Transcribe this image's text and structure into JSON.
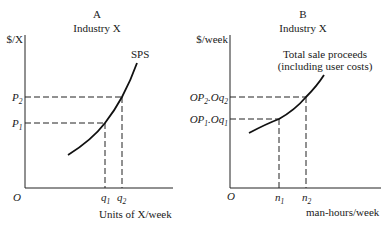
{
  "panel_a": {
    "letter": "A",
    "title": "Industry X",
    "y_label": "$/X",
    "x_label": "Units of X/week",
    "origin": "O",
    "curve_label": "SPS",
    "y_ticks": [
      {
        "base": "P",
        "sub": "2"
      },
      {
        "base": "P",
        "sub": "1"
      }
    ],
    "x_ticks": [
      {
        "base": "q",
        "sub": "1"
      },
      {
        "base": "q",
        "sub": "2"
      }
    ]
  },
  "panel_b": {
    "letter": "B",
    "title": "Industry X",
    "y_label": "$/week",
    "x_label": "man-hours/week",
    "origin": "O",
    "curve_label_line1": "Total sale proceeds",
    "curve_label_line2": "(including user costs)",
    "y_ticks": [
      {
        "base1": "OP",
        "sub1": "2",
        "mid": ".Oq",
        "sub2": "2"
      },
      {
        "base1": "OP",
        "sub1": "1",
        "mid": ".Oq",
        "sub2": "1"
      }
    ],
    "x_ticks": [
      {
        "base": "n",
        "sub": "1"
      },
      {
        "base": "n",
        "sub": "2"
      }
    ]
  }
}
